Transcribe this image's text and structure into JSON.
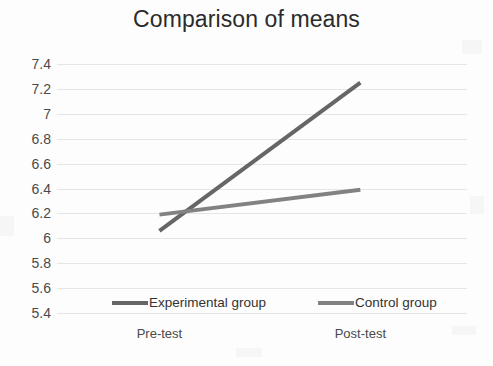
{
  "chart_data": {
    "type": "line",
    "title": "Comparison of means",
    "xlabel": "",
    "ylabel": "",
    "categories": [
      "Pre-test",
      "Post-test"
    ],
    "series": [
      {
        "name": "Experimental group",
        "values": [
          6.06,
          7.25
        ],
        "color": "#666666"
      },
      {
        "name": "Control group",
        "values": [
          6.19,
          6.39
        ],
        "color": "#828282"
      }
    ],
    "ylim": [
      5.4,
      7.4
    ],
    "ytick_values": [
      7.4,
      7.2,
      7.0,
      6.8,
      6.6,
      6.4,
      6.2,
      6.0,
      5.8,
      5.6,
      5.4
    ],
    "ytick_labels": [
      "7.4",
      "7.2",
      "7",
      "6.8",
      "6.6",
      "6.4",
      "6.2",
      "6",
      "5.8",
      "5.6",
      "5.4"
    ],
    "grid": true,
    "grid_color": "#e6e6e6",
    "legend_position": "bottom",
    "background": "#ffffff"
  },
  "chart": {
    "title": "Comparison of means",
    "y_ticks": [
      "7.4",
      "7.2",
      "7",
      "6.8",
      "6.6",
      "6.4",
      "6.2",
      "6",
      "5.8",
      "5.6",
      "5.4"
    ],
    "x_ticks": [
      "Pre-test",
      "Post-test"
    ],
    "legend": [
      {
        "label": "Experimental group",
        "color": "#666666"
      },
      {
        "label": "Control group",
        "color": "#828282"
      }
    ]
  }
}
